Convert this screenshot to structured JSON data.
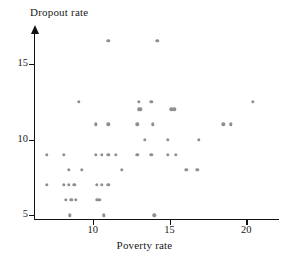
{
  "chart_data": {
    "type": "scatter",
    "title": "",
    "xlabel": "Poverty rate",
    "ylabel": "Dropout rate",
    "xlim": [
      6.3,
      21.8
    ],
    "ylim": [
      4.75,
      17.1
    ],
    "xticks": [
      10,
      15,
      20
    ],
    "xticklabels": [
      "10",
      "15",
      "20"
    ],
    "yticks": [
      5,
      10,
      15
    ],
    "yticklabels": [
      "5",
      "10",
      "15"
    ],
    "grid": false,
    "legend": null,
    "marker": "circle",
    "marker_color": "#8e8e8e",
    "axis_color": "#111111",
    "points": [
      [
        7.0,
        9.0
      ],
      [
        7.0,
        7.0
      ],
      [
        8.1,
        9.0
      ],
      [
        8.1,
        7.0
      ],
      [
        8.25,
        6.0
      ],
      [
        8.45,
        8.0
      ],
      [
        8.45,
        7.0
      ],
      [
        8.6,
        6.0
      ],
      [
        8.5,
        5.0
      ],
      [
        8.8,
        7.0
      ],
      [
        8.9,
        6.0
      ],
      [
        9.3,
        8.0
      ],
      [
        10.2,
        9.0
      ],
      [
        10.2,
        11.0
      ],
      [
        10.25,
        7.0
      ],
      [
        10.3,
        6.0
      ],
      [
        10.45,
        6.0
      ],
      [
        10.6,
        9.0
      ],
      [
        10.6,
        7.0
      ],
      [
        10.7,
        5.0
      ],
      [
        11.0,
        9.0
      ],
      [
        11.0,
        11.0
      ],
      [
        11.0,
        7.0
      ],
      [
        11.0,
        16.5
      ],
      [
        11.5,
        9.0
      ],
      [
        9.1,
        12.5
      ],
      [
        11.9,
        8.0
      ],
      [
        12.9,
        9.0
      ],
      [
        12.9,
        11.0
      ],
      [
        13.0,
        12.0
      ],
      [
        13.1,
        12.0
      ],
      [
        13.0,
        12.5
      ],
      [
        13.4,
        10.0
      ],
      [
        13.8,
        9.0
      ],
      [
        13.9,
        11.0
      ],
      [
        13.8,
        12.5
      ],
      [
        14.0,
        5.0
      ],
      [
        14.2,
        16.5
      ],
      [
        14.9,
        9.0
      ],
      [
        14.9,
        10.0
      ],
      [
        15.1,
        12.0
      ],
      [
        15.3,
        12.0
      ],
      [
        15.4,
        9.0
      ],
      [
        16.1,
        8.0
      ],
      [
        16.8,
        8.0
      ],
      [
        16.9,
        10.0
      ],
      [
        18.5,
        11.0
      ],
      [
        19.0,
        11.0
      ],
      [
        20.4,
        12.5
      ]
    ]
  },
  "figure": {
    "ylabel_text": "Dropout rate",
    "xlabel_text": "Poverty rate"
  }
}
